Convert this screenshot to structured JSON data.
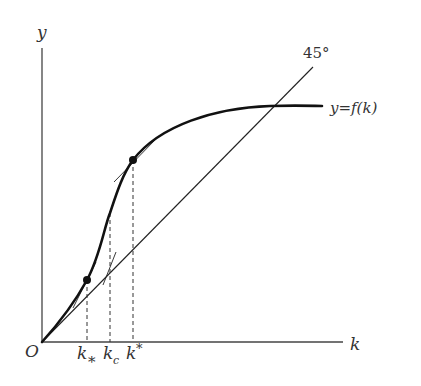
{
  "diagram": {
    "axes": {
      "y_label": "y",
      "x_label": "k",
      "origin_label": "O"
    },
    "reference_line": {
      "label": "45°",
      "description": "45-degree line y = k"
    },
    "curve": {
      "label": "y=f(k)",
      "description": "S-shaped production function, convex then concave"
    },
    "points": [
      {
        "id": "k_lower",
        "label_main": "k",
        "label_sub": "*",
        "sub_style": "subscript",
        "description": "lower point on curve where tangent touches"
      },
      {
        "id": "k_c",
        "label_main": "k",
        "label_sub": "c",
        "sub_style": "subscript",
        "description": "inflection point"
      },
      {
        "id": "k_upper",
        "label_main": "k",
        "label_sub": "*",
        "sub_style": "superscript",
        "description": "upper point on curve where tangent touches"
      }
    ],
    "colors": {
      "ink": "#222222",
      "label": "#333333",
      "background": "#ffffff"
    }
  }
}
